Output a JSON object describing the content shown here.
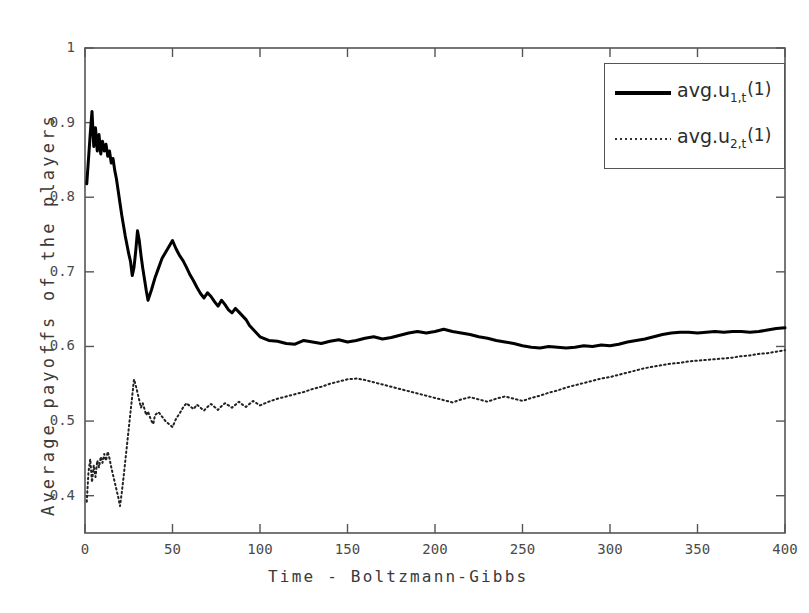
{
  "chart_data": {
    "type": "line",
    "title": "",
    "xlabel": "Time  -  Boltzmann-Gibbs",
    "ylabel": "Average payoffs of the players",
    "xlim": [
      0,
      400
    ],
    "ylim": [
      0.35,
      1.0
    ],
    "grid": false,
    "legend_position": "top-right",
    "xticks": [
      0,
      50,
      100,
      150,
      200,
      250,
      300,
      350,
      400
    ],
    "xtick_labels": [
      "0",
      "50",
      "100",
      "150",
      "200",
      "250",
      "300",
      "350",
      "400"
    ],
    "yticks": [
      0.4,
      0.5,
      0.6,
      0.7,
      0.8,
      0.9,
      1
    ],
    "ytick_labels": [
      "0.4",
      "0.5",
      "0.6",
      "0.7",
      "0.8",
      "0.9",
      "1"
    ],
    "series": [
      {
        "name": "avg.u_{1,t}(1)",
        "label_base": "avg.u",
        "label_sub": "1,t",
        "label_sup": "(1)",
        "style": "solid",
        "color": "#000000",
        "linewidth": 3,
        "x": [
          1,
          3,
          4,
          5,
          6,
          7,
          8,
          9,
          10,
          11,
          12,
          13,
          14,
          15,
          16,
          17,
          18,
          19,
          20,
          21,
          22,
          23,
          24,
          25,
          26,
          27,
          28,
          29,
          30,
          31,
          32,
          33,
          34,
          35,
          36,
          37,
          38,
          39,
          40,
          42,
          44,
          46,
          48,
          50,
          52,
          54,
          56,
          58,
          60,
          62,
          64,
          66,
          68,
          70,
          72,
          74,
          76,
          78,
          80,
          82,
          84,
          86,
          88,
          90,
          92,
          94,
          96,
          98,
          100,
          105,
          110,
          115,
          120,
          125,
          130,
          135,
          140,
          145,
          150,
          155,
          160,
          165,
          170,
          175,
          180,
          185,
          190,
          195,
          200,
          205,
          210,
          215,
          220,
          225,
          230,
          235,
          240,
          245,
          250,
          255,
          260,
          265,
          270,
          275,
          280,
          285,
          290,
          295,
          300,
          305,
          310,
          315,
          320,
          325,
          330,
          335,
          340,
          345,
          350,
          355,
          360,
          365,
          370,
          375,
          380,
          385,
          390,
          395,
          400
        ],
        "y": [
          0.818,
          0.885,
          0.915,
          0.868,
          0.893,
          0.862,
          0.884,
          0.858,
          0.875,
          0.862,
          0.871,
          0.855,
          0.862,
          0.846,
          0.852,
          0.836,
          0.824,
          0.808,
          0.792,
          0.776,
          0.762,
          0.748,
          0.736,
          0.724,
          0.714,
          0.695,
          0.706,
          0.728,
          0.755,
          0.742,
          0.722,
          0.705,
          0.69,
          0.675,
          0.662,
          0.669,
          0.676,
          0.684,
          0.692,
          0.705,
          0.718,
          0.726,
          0.734,
          0.742,
          0.731,
          0.722,
          0.715,
          0.706,
          0.696,
          0.688,
          0.679,
          0.671,
          0.665,
          0.672,
          0.667,
          0.66,
          0.654,
          0.662,
          0.656,
          0.649,
          0.645,
          0.651,
          0.646,
          0.641,
          0.636,
          0.628,
          0.623,
          0.618,
          0.613,
          0.608,
          0.607,
          0.604,
          0.603,
          0.608,
          0.606,
          0.604,
          0.607,
          0.609,
          0.606,
          0.608,
          0.611,
          0.613,
          0.61,
          0.612,
          0.615,
          0.618,
          0.62,
          0.618,
          0.62,
          0.623,
          0.62,
          0.618,
          0.616,
          0.613,
          0.611,
          0.608,
          0.606,
          0.604,
          0.601,
          0.599,
          0.598,
          0.6,
          0.599,
          0.598,
          0.599,
          0.601,
          0.6,
          0.602,
          0.601,
          0.603,
          0.606,
          0.608,
          0.61,
          0.613,
          0.616,
          0.618,
          0.619,
          0.619,
          0.618,
          0.619,
          0.62,
          0.619,
          0.62,
          0.62,
          0.619,
          0.62,
          0.622,
          0.624,
          0.625
        ]
      },
      {
        "name": "avg.u_{2,t}(1)",
        "label_base": "avg.u",
        "label_sub": "2,t",
        "label_sup": "(1)",
        "style": "dotted",
        "color": "#222222",
        "linewidth": 2,
        "x": [
          1,
          2,
          3,
          4,
          5,
          6,
          7,
          8,
          9,
          10,
          11,
          12,
          13,
          14,
          15,
          16,
          17,
          18,
          19,
          20,
          21,
          22,
          23,
          24,
          25,
          26,
          27,
          28,
          29,
          30,
          31,
          32,
          33,
          34,
          35,
          36,
          37,
          38,
          39,
          40,
          42,
          44,
          46,
          48,
          50,
          52,
          54,
          56,
          58,
          60,
          62,
          64,
          66,
          68,
          70,
          72,
          74,
          76,
          78,
          80,
          82,
          84,
          86,
          88,
          90,
          92,
          94,
          96,
          98,
          100,
          105,
          110,
          115,
          120,
          125,
          130,
          135,
          140,
          145,
          150,
          155,
          160,
          165,
          170,
          175,
          180,
          185,
          190,
          195,
          200,
          205,
          210,
          215,
          220,
          225,
          230,
          235,
          240,
          245,
          250,
          255,
          260,
          265,
          270,
          275,
          280,
          285,
          290,
          295,
          300,
          305,
          310,
          315,
          320,
          325,
          330,
          335,
          340,
          345,
          350,
          355,
          360,
          365,
          370,
          375,
          380,
          385,
          390,
          395,
          400
        ],
        "y": [
          0.392,
          0.432,
          0.449,
          0.418,
          0.441,
          0.425,
          0.447,
          0.438,
          0.452,
          0.444,
          0.456,
          0.447,
          0.459,
          0.45,
          0.438,
          0.428,
          0.418,
          0.408,
          0.398,
          0.386,
          0.404,
          0.424,
          0.446,
          0.468,
          0.49,
          0.512,
          0.534,
          0.556,
          0.548,
          0.538,
          0.528,
          0.518,
          0.524,
          0.516,
          0.508,
          0.513,
          0.506,
          0.5,
          0.496,
          0.508,
          0.512,
          0.506,
          0.5,
          0.496,
          0.492,
          0.503,
          0.51,
          0.518,
          0.524,
          0.52,
          0.516,
          0.522,
          0.518,
          0.514,
          0.519,
          0.523,
          0.519,
          0.515,
          0.52,
          0.524,
          0.521,
          0.518,
          0.522,
          0.526,
          0.522,
          0.519,
          0.523,
          0.527,
          0.524,
          0.521,
          0.526,
          0.53,
          0.533,
          0.536,
          0.539,
          0.543,
          0.546,
          0.55,
          0.553,
          0.556,
          0.557,
          0.555,
          0.552,
          0.549,
          0.546,
          0.543,
          0.54,
          0.537,
          0.534,
          0.531,
          0.528,
          0.525,
          0.529,
          0.532,
          0.529,
          0.526,
          0.53,
          0.533,
          0.53,
          0.527,
          0.531,
          0.534,
          0.538,
          0.541,
          0.545,
          0.548,
          0.551,
          0.554,
          0.557,
          0.559,
          0.562,
          0.565,
          0.568,
          0.571,
          0.573,
          0.575,
          0.577,
          0.578,
          0.58,
          0.581,
          0.582,
          0.583,
          0.584,
          0.585,
          0.587,
          0.588,
          0.59,
          0.591,
          0.593,
          0.595
        ]
      }
    ]
  },
  "axes": {
    "frame_color": "#555555",
    "background": "#ffffff"
  }
}
